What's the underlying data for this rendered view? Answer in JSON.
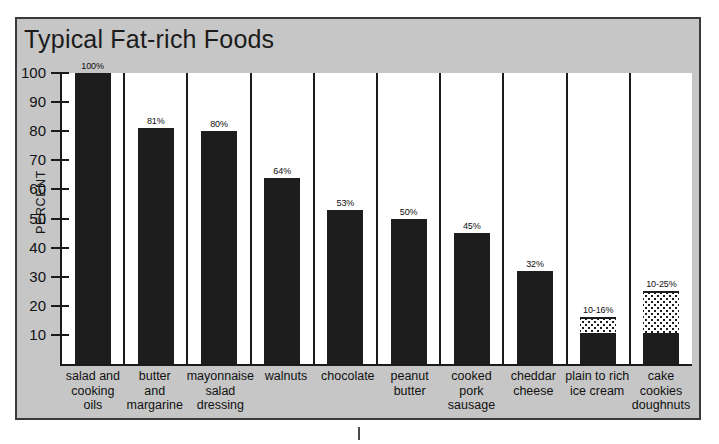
{
  "chart_data": {
    "type": "bar",
    "title": "Typical Fat-rich Foods",
    "xlabel": "",
    "ylabel": "PERCENT",
    "ylim": [
      0,
      100
    ],
    "yticks": [
      100,
      90,
      80,
      70,
      60,
      50,
      40,
      30,
      20,
      10
    ],
    "grid": false,
    "legend": "none",
    "categories": [
      "salad and cooking oils",
      "butter and margarine",
      "mayonnaise salad dressing",
      "walnuts",
      "chocolate",
      "peanut butter",
      "cooked pork sausage",
      "cheddar cheese",
      "plain to rich ice cream",
      "cake cookies doughnuts"
    ],
    "values": [
      100,
      81,
      80,
      64,
      53,
      50,
      45,
      32,
      16,
      25
    ],
    "value_labels": [
      "100%",
      "81%",
      "80%",
      "64%",
      "53%",
      "50%",
      "45%",
      "32%",
      "10-16%",
      "10-25%"
    ],
    "bars": [
      {
        "lines": [
          "salad and",
          "cooking",
          "oils"
        ],
        "label": "100%",
        "solid_to": 100,
        "range_from": null,
        "range_to": null
      },
      {
        "lines": [
          "butter",
          "and",
          "margarine"
        ],
        "label": "81%",
        "solid_to": 81,
        "range_from": null,
        "range_to": null
      },
      {
        "lines": [
          "mayonnaise",
          "salad",
          "dressing"
        ],
        "label": "80%",
        "solid_to": 80,
        "range_from": null,
        "range_to": null
      },
      {
        "lines": [
          "walnuts"
        ],
        "label": "64%",
        "solid_to": 64,
        "range_from": null,
        "range_to": null
      },
      {
        "lines": [
          "chocolate"
        ],
        "label": "53%",
        "solid_to": 53,
        "range_from": null,
        "range_to": null
      },
      {
        "lines": [
          "peanut",
          "butter"
        ],
        "label": "50%",
        "solid_to": 50,
        "range_from": null,
        "range_to": null
      },
      {
        "lines": [
          "cooked",
          "pork",
          "sausage"
        ],
        "label": "45%",
        "solid_to": 45,
        "range_from": null,
        "range_to": null
      },
      {
        "lines": [
          "cheddar",
          "cheese"
        ],
        "label": "32%",
        "solid_to": 32,
        "range_from": null,
        "range_to": null
      },
      {
        "lines": [
          "plain to rich",
          "ice cream"
        ],
        "label": "10-16%",
        "solid_to": 10,
        "range_from": 10,
        "range_to": 16
      },
      {
        "lines": [
          "cake",
          "cookies",
          "doughnuts"
        ],
        "label": "10-25%",
        "solid_to": 10,
        "range_from": 10,
        "range_to": 25
      }
    ]
  },
  "colors": {
    "panel_background": "#c6c6c6",
    "panel_border": "#3a3a3a",
    "bar_fill": "#1d1d1d",
    "plot_background": "#ffffff",
    "axis": "#1a1a1a",
    "text": "#111111"
  }
}
